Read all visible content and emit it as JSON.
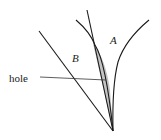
{
  "diagram": {
    "labels": {
      "a": "A",
      "b": "B",
      "hole": "hole"
    },
    "colors": {
      "stroke": "#1a1a1a",
      "hole_fill": "#c4c4c4",
      "background": "#ffffff"
    }
  }
}
